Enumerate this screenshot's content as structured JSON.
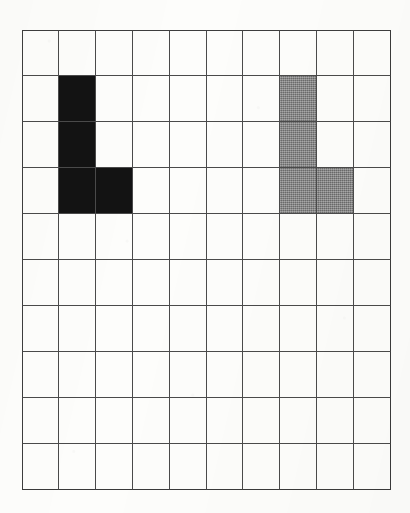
{
  "page": {
    "background_color": "#fdfdfb",
    "width": 410,
    "height": 513
  },
  "grid": {
    "columns": 10,
    "rows": 10,
    "line_color": "#4a4a4a",
    "border_color": "#3a3a3a",
    "cell_background": "#fdfdfb",
    "left": 22,
    "top": 30,
    "width": 369,
    "height": 460
  },
  "shapes": [
    {
      "name": "black-l-tetromino",
      "label": "Black L shape",
      "color": "#131313",
      "fill_style": "solid",
      "cells": [
        {
          "row": 2,
          "col": 2
        },
        {
          "row": 3,
          "col": 2
        },
        {
          "row": 4,
          "col": 2
        },
        {
          "row": 4,
          "col": 3
        }
      ]
    },
    {
      "name": "gray-l-tetromino",
      "label": "Gray L shape",
      "color": "#7d7d7d",
      "fill_style": "halftone",
      "cells": [
        {
          "row": 2,
          "col": 8
        },
        {
          "row": 3,
          "col": 8
        },
        {
          "row": 4,
          "col": 8
        },
        {
          "row": 4,
          "col": 9
        }
      ]
    }
  ]
}
